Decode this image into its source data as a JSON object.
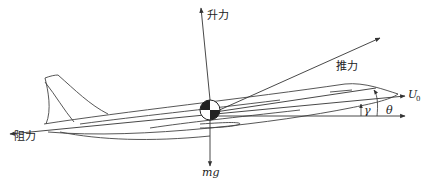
{
  "diagram": {
    "labels": {
      "lift": "升力",
      "thrust": "推力",
      "drag": "阻力",
      "weight": "mg",
      "velocity": "U",
      "velocity_subscript": "0",
      "flight_path_angle": "γ",
      "pitch_angle": "θ"
    },
    "colors": {
      "line": "#333333",
      "background": "#ffffff",
      "cg_fill": "#222222"
    }
  }
}
